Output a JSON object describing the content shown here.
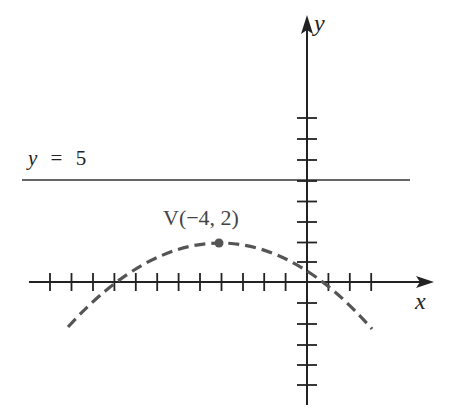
{
  "diagram": {
    "type": "parabola-graph",
    "axes": {
      "x_label": "x",
      "y_label": "y",
      "x_ticks_range": [
        -13,
        3
      ],
      "y_ticks_range": [
        -5,
        8
      ]
    },
    "line": {
      "label_var": "y",
      "label_eq": "=",
      "label_val": "5",
      "equation": "y = 5"
    },
    "vertex": {
      "label": "V(−4, 2)",
      "x": -4,
      "y": 2
    },
    "curve": {
      "style": "dashed",
      "color": "#555555",
      "opens": "down"
    }
  }
}
